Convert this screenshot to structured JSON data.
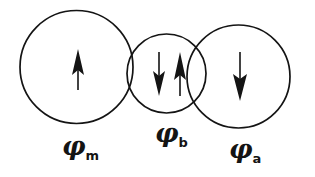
{
  "figure": {
    "width": 315,
    "height": 177,
    "background_color": "#ffffff",
    "stroke_color": "#141414"
  },
  "chart_data": {
    "type": "diagram",
    "title": "",
    "circles": [
      {
        "id": "phi-m",
        "label_symbol": "φ",
        "label_subscript": "m",
        "cx": 76.5,
        "cy": 67,
        "r": 56.5,
        "label_x": 62,
        "label_y": 133
      },
      {
        "id": "phi-b",
        "label_symbol": "φ",
        "label_subscript": "b",
        "cx": 166.5,
        "cy": 73.5,
        "r": 39.5,
        "label_x": 155,
        "label_y": 120
      },
      {
        "id": "phi-a",
        "label_symbol": "φ",
        "label_subscript": "a",
        "cx": 238.5,
        "cy": 76.5,
        "r": 51.5,
        "label_x": 229,
        "label_y": 136
      }
    ],
    "arrows": [
      {
        "id": "arrow-phi-m",
        "circle": "phi-m",
        "direction": "up",
        "x": 78,
        "y_top": 50,
        "y_bottom": 90
      },
      {
        "id": "arrow-phi-b-down",
        "circle": "phi-b",
        "direction": "down",
        "x": 159,
        "y_top": 52,
        "y_bottom": 95
      },
      {
        "id": "arrow-phi-b-up",
        "circle": "phi-b",
        "direction": "up",
        "x": 180,
        "y_top": 52,
        "y_bottom": 95
      },
      {
        "id": "arrow-phi-a",
        "circle": "phi-a",
        "direction": "down",
        "x": 240,
        "y_top": 52,
        "y_bottom": 100
      }
    ]
  },
  "labels": {
    "phi_m": {
      "symbol": "φ",
      "subscript": "m"
    },
    "phi_b": {
      "symbol": "φ",
      "subscript": "b"
    },
    "phi_a": {
      "symbol": "φ",
      "subscript": "a"
    }
  }
}
